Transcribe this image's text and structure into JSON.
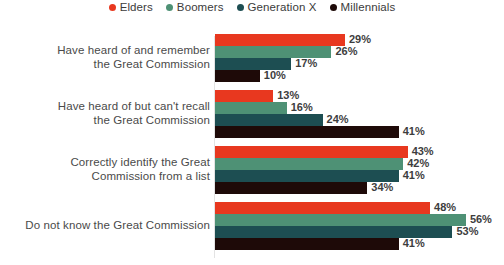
{
  "legend": {
    "position": "top-center",
    "items": [
      {
        "label": "Elders",
        "color": "#E8381F",
        "icon": "legend-dot-icon"
      },
      {
        "label": "Boomers",
        "color": "#4E9175",
        "icon": "legend-dot-icon"
      },
      {
        "label": "Generation X",
        "color": "#1D4E52",
        "icon": "legend-dot-icon"
      },
      {
        "label": "Millennials",
        "color": "#1E0A08",
        "icon": "legend-dot-icon"
      }
    ]
  },
  "chart_data": {
    "type": "bar",
    "orientation": "horizontal",
    "title": "",
    "subtitle": "",
    "xlabel": "",
    "ylabel": "",
    "grid": false,
    "axis_visible": true,
    "value_suffix": "%",
    "xlim": [
      0,
      60
    ],
    "categories": [
      "Have heard of and remember the Great Commission",
      "Have heard of but can't recall the Great Commission",
      "Correctly identify the Great Commission from a list",
      "Do not know the Great Commission"
    ],
    "category_lines": [
      [
        "Have heard of and remember",
        "the Great Commission"
      ],
      [
        "Have heard of but can't recall",
        "the Great Commission"
      ],
      [
        "Correctly identify the Great",
        "Commission from a list"
      ],
      [
        "Do not know the Great Commission"
      ]
    ],
    "series": [
      {
        "name": "Elders",
        "color": "#E8381F",
        "values": [
          29,
          13,
          43,
          48
        ],
        "labels": [
          "29%",
          "13%",
          "43%",
          "48%"
        ]
      },
      {
        "name": "Boomers",
        "color": "#4E9175",
        "values": [
          26,
          16,
          42,
          56
        ],
        "labels": [
          "26%",
          "16%",
          "42%",
          "56%"
        ]
      },
      {
        "name": "Generation X",
        "color": "#1D4E52",
        "values": [
          17,
          24,
          41,
          53
        ],
        "labels": [
          "17%",
          "24%",
          "41%",
          "53%"
        ]
      },
      {
        "name": "Millennials",
        "color": "#1E0A08",
        "values": [
          10,
          41,
          34,
          41
        ],
        "labels": [
          "10%",
          "41%",
          "34%",
          "41%"
        ]
      }
    ]
  }
}
